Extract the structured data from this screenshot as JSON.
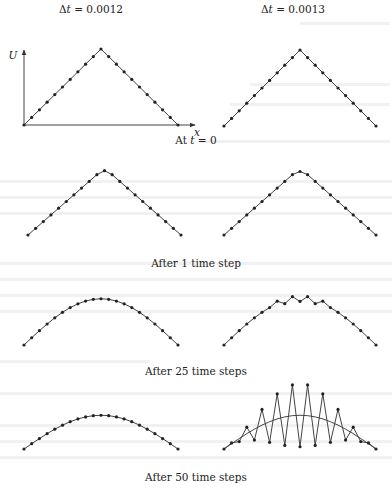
{
  "figure": {
    "column_headers": [
      {
        "prefix": "Δ",
        "var": "t",
        "eq": " = ",
        "value": "0.0012"
      },
      {
        "prefix": "Δ",
        "var": "t",
        "eq": " = ",
        "value": "0.0013"
      }
    ],
    "axis_labels": {
      "y": "U",
      "x": "x"
    },
    "row_captions": [
      {
        "text_before": "At ",
        "var": "t",
        "text_after": " = 0"
      },
      {
        "text_before": "After 1 time step",
        "var": "",
        "text_after": ""
      },
      {
        "text_before": "After 25 time steps",
        "var": "",
        "text_after": ""
      },
      {
        "text_before": "After 50 time steps",
        "var": "",
        "text_after": ""
      }
    ]
  },
  "chart_data": {
    "type": "line",
    "xlabel": "x",
    "ylabel": "U",
    "grid": false,
    "nodes": 21,
    "x": [
      0,
      0.05,
      0.1,
      0.15,
      0.2,
      0.25,
      0.3,
      0.35,
      0.4,
      0.45,
      0.5,
      0.55,
      0.6,
      0.65,
      0.7,
      0.75,
      0.8,
      0.85,
      0.9,
      0.95,
      1.0
    ],
    "panels": [
      {
        "row": "At t = 0",
        "column": "Δt = 0.0012",
        "shape": "triangle",
        "peak": 1.0,
        "values": [
          0,
          0.1,
          0.2,
          0.3,
          0.4,
          0.5,
          0.6,
          0.7,
          0.8,
          0.9,
          1.0,
          0.9,
          0.8,
          0.7,
          0.6,
          0.5,
          0.4,
          0.3,
          0.2,
          0.1,
          0
        ]
      },
      {
        "row": "At t = 0",
        "column": "Δt = 0.0013",
        "shape": "triangle",
        "peak": 1.0,
        "values": [
          0,
          0.1,
          0.2,
          0.3,
          0.4,
          0.5,
          0.6,
          0.7,
          0.8,
          0.9,
          1.0,
          0.9,
          0.8,
          0.7,
          0.6,
          0.5,
          0.4,
          0.3,
          0.2,
          0.1,
          0
        ]
      },
      {
        "row": "After 1 time step",
        "column": "Δt = 0.0012",
        "shape": "triangle with flattened peak",
        "peak": 0.96,
        "values": [
          0,
          0.1,
          0.2,
          0.3,
          0.4,
          0.5,
          0.6,
          0.7,
          0.8,
          0.9,
          0.96,
          0.9,
          0.8,
          0.7,
          0.6,
          0.5,
          0.4,
          0.3,
          0.2,
          0.1,
          0
        ]
      },
      {
        "row": "After 1 time step",
        "column": "Δt = 0.0013",
        "shape": "triangle with flattened peak",
        "peak": 0.948,
        "values": [
          0,
          0.1,
          0.2,
          0.3,
          0.4,
          0.5,
          0.6,
          0.7,
          0.8,
          0.9,
          0.948,
          0.9,
          0.8,
          0.7,
          0.6,
          0.5,
          0.4,
          0.3,
          0.2,
          0.1,
          0
        ]
      },
      {
        "row": "After 25 time steps",
        "column": "Δt = 0.0012",
        "shape": "smooth arch",
        "peak": 0.69
      },
      {
        "row": "After 25 time steps",
        "column": "Δt = 0.0013",
        "shape": "arch with small oscillation near peak",
        "peak": 0.69
      },
      {
        "row": "After 50 time steps",
        "column": "Δt = 0.0012",
        "shape": "smooth arch",
        "peak": 0.45
      },
      {
        "row": "After 50 time steps",
        "column": "Δt = 0.0013",
        "shape": "large sawtooth oscillation about smooth arch (unstable)",
        "peak": 0.45
      }
    ]
  }
}
